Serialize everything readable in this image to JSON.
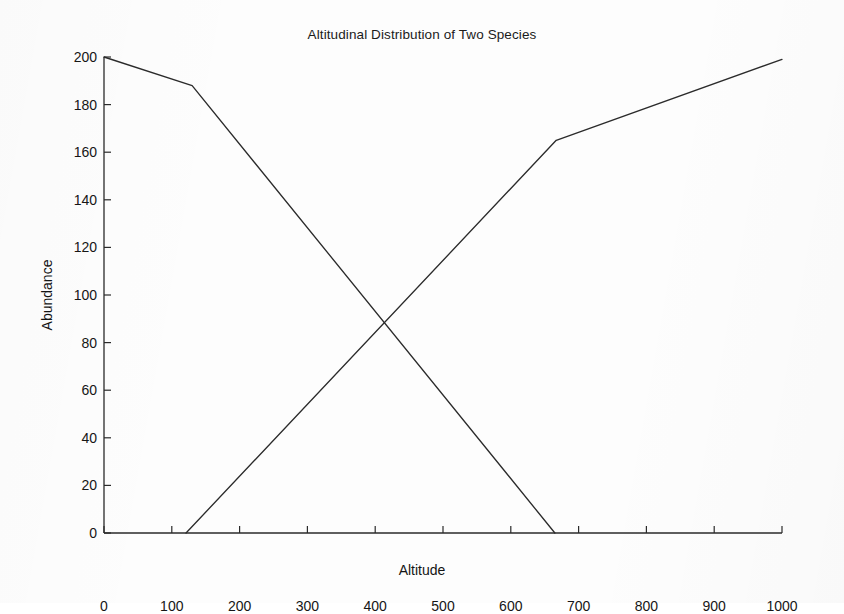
{
  "chart_data": {
    "type": "line",
    "title": "Altitudinal Distribution of Two Species",
    "xlabel": "Altitude",
    "ylabel": "Abundance",
    "xlim": [
      0,
      1000
    ],
    "ylim": [
      0,
      200
    ],
    "xticks": [
      0,
      100,
      200,
      300,
      400,
      500,
      600,
      700,
      800,
      900,
      1000
    ],
    "yticks": [
      0,
      20,
      40,
      60,
      80,
      100,
      120,
      140,
      160,
      180,
      200
    ],
    "grid": false,
    "legend": null,
    "line_color": "#2b2b2b",
    "series": [
      {
        "name": "Species 1 (declining)",
        "x": [
          0,
          130,
          665
        ],
        "values": [
          200,
          188,
          0
        ]
      },
      {
        "name": "Species 2 (increasing)",
        "x": [
          121,
          667,
          1000
        ],
        "values": [
          0,
          165,
          199
        ]
      }
    ],
    "annotations": [
      {
        "text": "crossover",
        "x": 417,
        "y": 85,
        "visible": false
      }
    ]
  },
  "axes": {
    "x_tick_labels": [
      "0",
      "100",
      "200",
      "300",
      "400",
      "500",
      "600",
      "700",
      "800",
      "900",
      "1000"
    ],
    "y_tick_labels": [
      "0",
      "20",
      "40",
      "60",
      "80",
      "100",
      "120",
      "140",
      "160",
      "180",
      "200"
    ]
  }
}
